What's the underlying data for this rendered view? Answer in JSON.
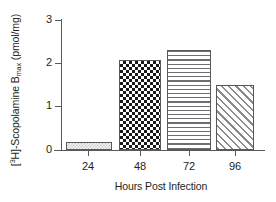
{
  "chart_data": {
    "type": "bar",
    "title": "",
    "subtitle": "",
    "xlabel": "Hours Post Infection",
    "ylabel": "[3H]-Scopolamine Bmax (pmol/mg)",
    "ylabel_parts": {
      "prefix": "[",
      "superscript": "3",
      "element": "H]-Scopolamine B",
      "subscript": "max",
      "units": " (pmol/mg)"
    },
    "categories": [
      "24",
      "48",
      "72",
      "96"
    ],
    "values": [
      0.19,
      2.07,
      2.3,
      1.51
    ],
    "series": [
      {
        "name": "[3H]-Scopolamine Bmax",
        "values": [
          0.19,
          2.07,
          2.3,
          1.51
        ]
      }
    ],
    "bar_patterns": [
      "light-stipple",
      "dark-checkerboard",
      "horizontal-lines",
      "diagonal-hatch"
    ],
    "ylim": [
      0,
      3
    ],
    "yticks": [
      0,
      1,
      2,
      3
    ],
    "ytick_labels": [
      "0",
      "1",
      "2",
      "3"
    ],
    "xtick_labels": [
      "24",
      "48",
      "72",
      "96"
    ],
    "grid": false,
    "legend": false,
    "legend_position": "none",
    "axis_color": "#58595b",
    "background_color": "#ffffff",
    "text_color": "#231f20"
  }
}
